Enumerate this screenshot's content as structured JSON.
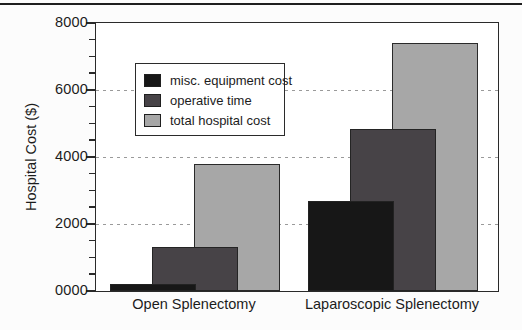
{
  "figure": {
    "top_rule_color": "#1f1f1f",
    "background_color": "#fcfcfc",
    "frame_color": "#2a2a2a"
  },
  "chart_data": {
    "type": "bar",
    "title": "",
    "xlabel": "",
    "ylabel": "Hospital Cost ($)",
    "ylim": [
      0,
      8000
    ],
    "ytick_interval": 2000,
    "minor_tick_interval": 500,
    "ytick_labels": [
      "0000",
      "2000",
      "4000",
      "6000",
      "8000"
    ],
    "gridlines": [
      2000,
      4000,
      6000
    ],
    "grid_style": "dashed",
    "grid_on": true,
    "legend_position": "upper-left-inside",
    "categories": [
      "Open Splenectomy",
      "Laparoscopic Splenectomy"
    ],
    "series": [
      {
        "name": "misc. equipment cost",
        "color": "#171717",
        "values": [
          200,
          2700
        ]
      },
      {
        "name": "operative time",
        "color": "#474347",
        "values": [
          1300,
          4850
        ]
      },
      {
        "name": "total hospital cost",
        "color": "#a7a7a7",
        "values": [
          3800,
          7400
        ]
      }
    ]
  }
}
